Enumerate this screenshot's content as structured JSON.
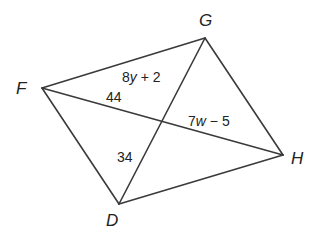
{
  "figure": {
    "type": "quadrilateral-with-diagonals",
    "vertices": [
      {
        "name": "G",
        "x": 205,
        "y": 38,
        "label_x": 199,
        "label_y": 26
      },
      {
        "name": "F",
        "x": 42,
        "y": 88,
        "label_x": 16,
        "label_y": 94
      },
      {
        "name": "H",
        "x": 283,
        "y": 155,
        "label_x": 291,
        "label_y": 164
      },
      {
        "name": "D",
        "x": 119,
        "y": 204,
        "label_x": 106,
        "label_y": 226
      }
    ],
    "intersection": {
      "x": 162,
      "y": 123
    },
    "sides": [
      [
        "F",
        "G"
      ],
      [
        "G",
        "H"
      ],
      [
        "H",
        "D"
      ],
      [
        "D",
        "F"
      ]
    ],
    "diagonals": [
      [
        "F",
        "H"
      ],
      [
        "G",
        "D"
      ]
    ],
    "segment_labels": [
      {
        "segment": "G-intersection",
        "coef": "8",
        "var": "y",
        "rest": " + 2",
        "x": 122,
        "y": 82
      },
      {
        "segment": "F-intersection",
        "text": "44",
        "x": 106,
        "y": 102
      },
      {
        "segment": "intersection-H",
        "coef": "7",
        "var": "w",
        "rest": " − 5",
        "x": 188,
        "y": 126
      },
      {
        "segment": "D-intersection",
        "text": "34",
        "x": 117,
        "y": 162
      }
    ]
  },
  "labels": {
    "G": "G",
    "F": "F",
    "H": "H",
    "D": "D",
    "seg_8y2_coef": "8",
    "seg_8y2_var": "y",
    "seg_8y2_rest": " + 2",
    "seg_44": "44",
    "seg_7w5_coef": "7",
    "seg_7w5_var": "w",
    "seg_7w5_rest": " − 5",
    "seg_34": "34"
  }
}
